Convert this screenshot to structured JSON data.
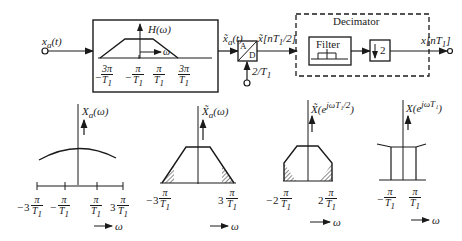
{
  "block_diagram": {
    "input_label": "x_a(t)",
    "antialias_filter": {
      "response_label": "H(ω)",
      "axis_label": "ω",
      "ticks": [
        "-3π/T1",
        "-π/T1",
        "π/T1",
        "3π/T1"
      ]
    },
    "filtered_signal_label": "x̃_a(t)",
    "adc": {
      "top": "A",
      "bottom": "D",
      "rate_label": "2/T1"
    },
    "sampled_signal_label": "x̃[nT1/2]",
    "decimator": {
      "title": "Decimator",
      "filter_label": "Filter",
      "downsample_label": "2"
    },
    "output_label": "x[nT1]"
  },
  "spectra": [
    {
      "label": "X_a(ω)",
      "ticks": [
        "-3π/T1",
        "-π/T1",
        "π/T1",
        "3π/T1"
      ],
      "axis": "ω"
    },
    {
      "label": "X̃_a(ω)",
      "ticks": [
        "-3π/T1",
        "3π/T1"
      ],
      "axis": "ω"
    },
    {
      "label": "X̃(e^{jωT1/2})",
      "ticks": [
        "-2π/T1",
        "2π/T1"
      ],
      "axis": "ω"
    },
    {
      "label": "X(e^{jωT1})",
      "ticks": [
        "-π/T1",
        "π/T1"
      ],
      "axis": "ω"
    }
  ],
  "text": {
    "xa": "x",
    "xa_sub": "a",
    "t": "(t)",
    "H": "H(ω)",
    "omega": "ω",
    "pi": "π",
    "threepi": "3π",
    "T": "T",
    "one": "1",
    "minus": "−",
    "three": "3",
    "two": "2",
    "A": "A",
    "D": "D",
    "rate": "2/T",
    "xs": "x̃[nT",
    "xs_end": "/2]",
    "decimator": "Decimator",
    "filter": "Filter",
    "down": "2",
    "xout": "x[nT",
    "xout_end": "]",
    "Xa": "X",
    "Xa_arg": "(ω)",
    "Xt": "X̃",
    "Xt_arg": "(e",
    "Xt_exp": "jωT₁/2",
    "close": ")",
    "X": "X(e",
    "X_exp": "jωT₁"
  }
}
